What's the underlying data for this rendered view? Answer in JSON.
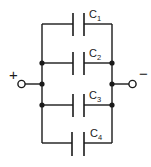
{
  "diagram": {
    "capacitors": [
      {
        "name": "C",
        "subscript": "1"
      },
      {
        "name": "C",
        "subscript": "2"
      },
      {
        "name": "C",
        "subscript": "3"
      },
      {
        "name": "C",
        "subscript": "4"
      }
    ],
    "terminals": {
      "positive": "+",
      "negative": "−"
    }
  }
}
